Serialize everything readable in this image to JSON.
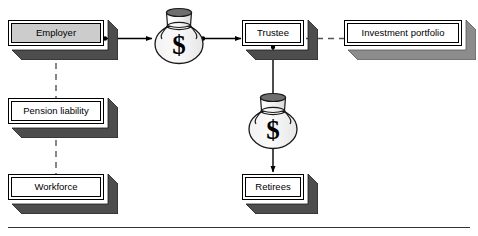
{
  "diagram": {
    "type": "flow-diagram",
    "title": "",
    "background_color": "#ffffff",
    "nodes": [
      {
        "id": "employer",
        "label": "Employer",
        "shape": "3d-box",
        "fill": "#cccccc",
        "shadow": "#4d4d4d",
        "x": 8,
        "y": 20,
        "w": 96,
        "h": 26
      },
      {
        "id": "pension-liability",
        "label": "Pension liability",
        "shape": "3d-box",
        "fill": "#ffffff",
        "shadow": "#4d4d4d",
        "x": 8,
        "y": 98,
        "w": 96,
        "h": 26
      },
      {
        "id": "workforce",
        "label": "Workforce",
        "shape": "3d-box",
        "fill": "#ffffff",
        "shadow": "#4d4d4d",
        "x": 8,
        "y": 174,
        "w": 96,
        "h": 26
      },
      {
        "id": "trustee",
        "label": "Trustee",
        "shape": "3d-box",
        "fill": "#ffffff",
        "shadow": "#4d4d4d",
        "x": 242,
        "y": 20,
        "w": 62,
        "h": 26
      },
      {
        "id": "investment-portfolio",
        "label": "Investment portfolio",
        "shape": "3d-box",
        "fill": "#ffffff",
        "shadow": "#8c8c8c",
        "x": 344,
        "y": 20,
        "w": 118,
        "h": 26
      },
      {
        "id": "retirees",
        "label": "Retirees",
        "shape": "3d-box",
        "fill": "#ffffff",
        "shadow": "#4d4d4d",
        "x": 242,
        "y": 174,
        "w": 62,
        "h": 26
      }
    ],
    "money_bags": [
      {
        "id": "money-bag-contributions",
        "symbol": "$",
        "cx": 179,
        "cy": 42,
        "rx": 24,
        "ry": 20
      },
      {
        "id": "money-bag-benefits",
        "symbol": "$",
        "cx": 273,
        "cy": 127,
        "rx": 24,
        "ry": 20
      }
    ],
    "connectors": [
      {
        "id": "employer-to-money-bag",
        "style": "solid-arrow",
        "from": "employer",
        "to": "money-bag-contributions"
      },
      {
        "id": "money-bag-to-trustee",
        "style": "solid-arrow",
        "from": "money-bag-contributions",
        "to": "trustee"
      },
      {
        "id": "trustee-to-investment-portfolio",
        "style": "dashed-line",
        "from": "trustee",
        "to": "investment-portfolio"
      },
      {
        "id": "trustee-to-retirees",
        "style": "solid-arrow",
        "from": "trustee",
        "to": "retirees"
      },
      {
        "id": "employer-to-workforce",
        "style": "dashed-line",
        "from": "employer",
        "to": "workforce"
      }
    ],
    "footer_rule": {
      "id": "bottom-rule",
      "x": 8,
      "y": 227,
      "w": 462,
      "h": 1,
      "color": "#333333"
    }
  }
}
